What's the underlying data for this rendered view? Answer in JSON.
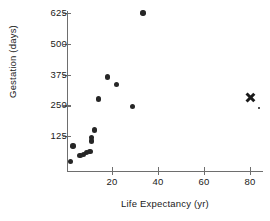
{
  "chart_data": {
    "type": "scatter",
    "title": "",
    "xlabel": "Life Expectancy (yr)",
    "ylabel": "Gestation (days)",
    "xlim": [
      0,
      85
    ],
    "ylim": [
      0,
      660
    ],
    "xticks": [
      20,
      40,
      60,
      80
    ],
    "yticks": [
      125,
      250,
      375,
      500,
      625
    ],
    "grid": false,
    "legend": null,
    "series": [
      {
        "name": "animals",
        "marker": "filled-circle",
        "color": "#262626",
        "points": [
          {
            "x": 33.5,
            "y": 625
          },
          {
            "x": 18.0,
            "y": 365
          },
          {
            "x": 22.0,
            "y": 335
          },
          {
            "x": 14.0,
            "y": 275
          },
          {
            "x": 29.0,
            "y": 245
          },
          {
            "x": 12.5,
            "y": 150
          },
          {
            "x": 11.0,
            "y": 120
          },
          {
            "x": 11.0,
            "y": 105
          },
          {
            "x": 3.0,
            "y": 85
          },
          {
            "x": 10.5,
            "y": 63
          },
          {
            "x": 9.0,
            "y": 58
          },
          {
            "x": 7.5,
            "y": 50
          },
          {
            "x": 6.0,
            "y": 45
          },
          {
            "x": 2.0,
            "y": 21
          }
        ]
      },
      {
        "name": "human",
        "marker": "x-cross",
        "color": "#1a1a1a",
        "points": [
          {
            "x": 80.0,
            "y": 280
          }
        ]
      }
    ]
  },
  "axes": {
    "y_tick_labels": [
      "625",
      "500",
      "375",
      "250",
      "125"
    ],
    "x_tick_labels": [
      "20",
      "40",
      "60",
      "80"
    ]
  }
}
